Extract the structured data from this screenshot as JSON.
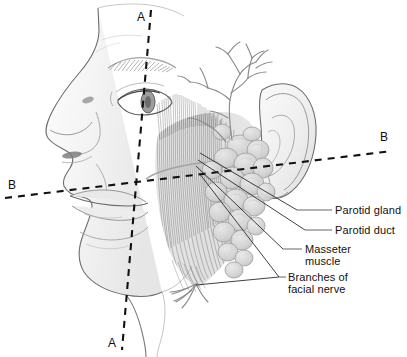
{
  "figure": {
    "background_color": "#ffffff",
    "ink_color": "#1a1a1a",
    "outline_color": "#6e6e6e",
    "shade_light": "#f0f0f0",
    "shade_mid": "#d8d8d8",
    "shade_dark": "#b4b4b4"
  },
  "section_markers": [
    {
      "id": "a-top",
      "label": "A",
      "x": 137,
      "y": 10
    },
    {
      "id": "a-bottom",
      "label": "A",
      "x": 108,
      "y": 336
    },
    {
      "id": "b-left",
      "label": "B",
      "x": 8,
      "y": 178
    },
    {
      "id": "b-right",
      "label": "B",
      "x": 380,
      "y": 130
    }
  ],
  "section_lines": [
    {
      "id": "plane-a",
      "style": "dashed",
      "from_x": 151,
      "from_y": 10,
      "to_x": 122,
      "to_y": 350
    },
    {
      "id": "plane-b",
      "style": "dashed",
      "from_x": 5,
      "from_y": 198,
      "to_x": 392,
      "to_y": 151
    }
  ],
  "labels": [
    {
      "id": "parotid-gland",
      "text": "Parotid gland",
      "lines": [
        "Parotid gland"
      ],
      "text_x": 335,
      "text_y": 204,
      "leader": {
        "x1": 297,
        "y1": 210,
        "x2": 332,
        "y2": 210
      },
      "pointer": {
        "x1": 200,
        "y1": 153,
        "x2": 297,
        "y2": 210
      }
    },
    {
      "id": "parotid-duct",
      "text": "Parotid duct",
      "lines": [
        "Parotid duct"
      ],
      "text_x": 335,
      "text_y": 224,
      "leader": {
        "x1": 305,
        "y1": 230,
        "x2": 332,
        "y2": 230
      },
      "pointer": {
        "x1": 198,
        "y1": 160,
        "x2": 305,
        "y2": 230
      }
    },
    {
      "id": "masseter-muscle",
      "text": "Masseter muscle",
      "lines": [
        "Masseter",
        "muscle"
      ],
      "text_x": 305,
      "text_y": 243,
      "leader": {
        "x1": 283,
        "y1": 249,
        "x2": 302,
        "y2": 249
      },
      "pointer": {
        "x1": 196,
        "y1": 166,
        "x2": 283,
        "y2": 249
      }
    },
    {
      "id": "branches-of-facial-nerve",
      "text": "Branches of facial nerve",
      "lines": [
        "Branches of",
        "facial nerve"
      ],
      "text_x": 288,
      "text_y": 271,
      "leader": {
        "x1": 279,
        "y1": 277,
        "x2": 286,
        "y2": 277
      },
      "pointer_upper": {
        "x1": 199,
        "y1": 173,
        "x2": 279,
        "y2": 277
      },
      "pointer_lower": {
        "x1": 196,
        "y1": 285,
        "x2": 279,
        "y2": 277
      }
    }
  ],
  "anatomy_parts": [
    {
      "id": "face-profile",
      "name": "Face profile outline"
    },
    {
      "id": "forehead",
      "name": "Forehead"
    },
    {
      "id": "eyebrow",
      "name": "Eyebrow"
    },
    {
      "id": "eye",
      "name": "Eye"
    },
    {
      "id": "nose",
      "name": "Nose"
    },
    {
      "id": "nostril",
      "name": "Nostril"
    },
    {
      "id": "lips",
      "name": "Lips"
    },
    {
      "id": "chin",
      "name": "Chin"
    },
    {
      "id": "jaw-neck",
      "name": "Jawline and neck"
    },
    {
      "id": "ear",
      "name": "Ear (auricle)"
    },
    {
      "id": "masseter",
      "name": "Masseter muscle fibers"
    },
    {
      "id": "parotid-gland-lobules",
      "name": "Parotid gland lobules"
    },
    {
      "id": "facial-nerve-branches",
      "name": "Facial nerve branches"
    },
    {
      "id": "parotid-duct-line",
      "name": "Parotid duct"
    }
  ]
}
